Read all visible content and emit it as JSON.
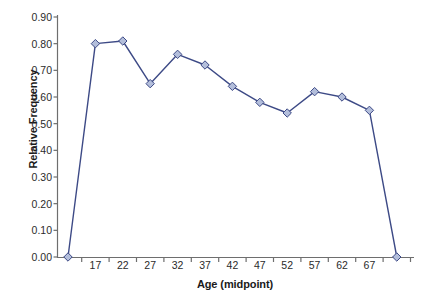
{
  "chart_data": {
    "type": "line",
    "title": "",
    "xlabel": "Age (midpoint)",
    "ylabel": "Relative Frequency",
    "categories": [
      "",
      "17",
      "22",
      "27",
      "32",
      "37",
      "42",
      "47",
      "52",
      "57",
      "62",
      "67",
      ""
    ],
    "values": [
      0.0,
      0.8,
      0.81,
      0.65,
      0.76,
      0.72,
      0.64,
      0.58,
      0.54,
      0.62,
      0.6,
      0.55,
      0.0
    ],
    "series": [
      {
        "name": "Relative Frequency",
        "values": [
          0.0,
          0.8,
          0.81,
          0.65,
          0.76,
          0.72,
          0.64,
          0.58,
          0.54,
          0.62,
          0.6,
          0.55,
          0.0
        ]
      }
    ],
    "ylim": [
      0.0,
      0.9
    ],
    "ytick_labels": [
      "0.90",
      "0.80",
      "0.70",
      "0.60",
      "0.50",
      "0.40",
      "0.30",
      "0.20",
      "0.10",
      "0.00"
    ],
    "ytick_values": [
      0.9,
      0.8,
      0.7,
      0.6,
      0.5,
      0.4,
      0.3,
      0.2,
      0.1,
      0.0
    ],
    "xtick_labels": [
      "17",
      "22",
      "27",
      "32",
      "37",
      "42",
      "47",
      "52",
      "57",
      "62",
      "67"
    ],
    "grid": false,
    "legend": false,
    "legend_position": "none",
    "marker": "diamond",
    "line_color": "#3d4a86",
    "marker_fill": "#b3bedb",
    "marker_edge": "#3d4a86",
    "axis_color": "#6e6e6e",
    "background": "#ffffff"
  }
}
